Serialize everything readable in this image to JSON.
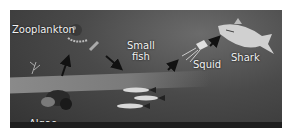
{
  "diagram": {
    "nodes": [
      {
        "id": "algae",
        "label": "Algae"
      },
      {
        "id": "zooplankton",
        "label": "Zooplankton"
      },
      {
        "id": "small_fish",
        "label": "Small fish",
        "label_lines": [
          "Small",
          "fish"
        ]
      },
      {
        "id": "squid",
        "label": "Squid"
      },
      {
        "id": "shark",
        "label": "Shark"
      }
    ],
    "edges": [
      {
        "from": "algae",
        "to": "zooplankton"
      },
      {
        "from": "zooplankton",
        "to": "small_fish"
      },
      {
        "from": "small_fish",
        "to": "squid"
      },
      {
        "from": "squid",
        "to": "shark"
      }
    ],
    "colors": {
      "background": "#4a4a4a",
      "label": "#f2f2f2",
      "arrow": "#111111"
    }
  }
}
